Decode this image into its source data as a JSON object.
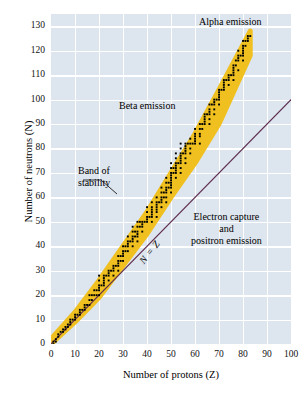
{
  "chart_data": {
    "type": "scatter",
    "title": "",
    "xlabel": "Number of protons (Z)",
    "ylabel": "Number of neutrons (N)",
    "xlim": [
      0,
      100
    ],
    "ylim": [
      0,
      135
    ],
    "xticks": [
      0,
      10,
      20,
      30,
      40,
      50,
      60,
      70,
      80,
      90,
      100
    ],
    "yticks": [
      0,
      10,
      20,
      30,
      40,
      50,
      60,
      70,
      80,
      90,
      100,
      110,
      120,
      130
    ],
    "grid": true,
    "legend": "none",
    "background_color": "#dde5ee",
    "gridline_color": "#ffffff",
    "band_color": "#efc01f",
    "point_color": "#000000",
    "line_color": "#5c2a4e",
    "annotations": [
      {
        "name": "alpha-emission",
        "text": "Alpha emission",
        "x": 74,
        "y": 133
      },
      {
        "name": "beta-emission",
        "text": "Beta emission",
        "x": 40,
        "y": 97
      },
      {
        "name": "band-of-stability",
        "text": "Band of\nstability",
        "x": 17,
        "y": 70
      },
      {
        "name": "electron-capture",
        "text": "Electron capture\nand\npositron emission",
        "x": 77,
        "y": 52
      },
      {
        "name": "n-equals-z",
        "text": "N = Z",
        "x": 47,
        "y": 40,
        "rotation": -52
      }
    ],
    "reference_line": {
      "name": "N = Z",
      "label": "N = Z",
      "from": [
        0,
        0
      ],
      "to": [
        100,
        100
      ],
      "color": "#5c2a4e"
    },
    "band_of_stability": {
      "lower_edge": [
        [
          0,
          0
        ],
        [
          10,
          9
        ],
        [
          20,
          19
        ],
        [
          30,
          32
        ],
        [
          40,
          45
        ],
        [
          50,
          60
        ],
        [
          60,
          74
        ],
        [
          70,
          90
        ],
        [
          83,
          118
        ]
      ],
      "upper_edge": [
        [
          0,
          2
        ],
        [
          10,
          13
        ],
        [
          20,
          26
        ],
        [
          30,
          40
        ],
        [
          40,
          54
        ],
        [
          50,
          70
        ],
        [
          60,
          86
        ],
        [
          70,
          104
        ],
        [
          83,
          128
        ]
      ]
    },
    "stable_nuclides": [
      [
        1,
        0
      ],
      [
        1,
        1
      ],
      [
        2,
        1
      ],
      [
        2,
        2
      ],
      [
        3,
        3
      ],
      [
        3,
        4
      ],
      [
        4,
        5
      ],
      [
        5,
        5
      ],
      [
        5,
        6
      ],
      [
        6,
        6
      ],
      [
        6,
        7
      ],
      [
        7,
        7
      ],
      [
        7,
        8
      ],
      [
        8,
        8
      ],
      [
        8,
        9
      ],
      [
        8,
        10
      ],
      [
        9,
        10
      ],
      [
        10,
        10
      ],
      [
        10,
        11
      ],
      [
        10,
        12
      ],
      [
        11,
        12
      ],
      [
        12,
        12
      ],
      [
        12,
        13
      ],
      [
        12,
        14
      ],
      [
        13,
        14
      ],
      [
        14,
        14
      ],
      [
        14,
        15
      ],
      [
        14,
        16
      ],
      [
        15,
        16
      ],
      [
        16,
        16
      ],
      [
        16,
        18
      ],
      [
        16,
        20
      ],
      [
        17,
        18
      ],
      [
        17,
        20
      ],
      [
        18,
        20
      ],
      [
        18,
        22
      ],
      [
        19,
        20
      ],
      [
        19,
        22
      ],
      [
        20,
        20
      ],
      [
        20,
        22
      ],
      [
        20,
        23
      ],
      [
        20,
        24
      ],
      [
        20,
        26
      ],
      [
        20,
        28
      ],
      [
        21,
        24
      ],
      [
        22,
        24
      ],
      [
        22,
        25
      ],
      [
        22,
        26
      ],
      [
        22,
        27
      ],
      [
        22,
        28
      ],
      [
        23,
        28
      ],
      [
        24,
        26
      ],
      [
        24,
        28
      ],
      [
        24,
        29
      ],
      [
        24,
        30
      ],
      [
        25,
        30
      ],
      [
        26,
        28
      ],
      [
        26,
        30
      ],
      [
        26,
        31
      ],
      [
        26,
        32
      ],
      [
        27,
        32
      ],
      [
        28,
        30
      ],
      [
        28,
        32
      ],
      [
        28,
        33
      ],
      [
        28,
        34
      ],
      [
        28,
        36
      ],
      [
        29,
        34
      ],
      [
        29,
        36
      ],
      [
        30,
        34
      ],
      [
        30,
        36
      ],
      [
        30,
        37
      ],
      [
        30,
        38
      ],
      [
        30,
        40
      ],
      [
        31,
        38
      ],
      [
        31,
        40
      ],
      [
        32,
        38
      ],
      [
        32,
        40
      ],
      [
        32,
        41
      ],
      [
        32,
        42
      ],
      [
        32,
        44
      ],
      [
        33,
        42
      ],
      [
        34,
        40
      ],
      [
        34,
        42
      ],
      [
        34,
        43
      ],
      [
        34,
        44
      ],
      [
        34,
        46
      ],
      [
        34,
        48
      ],
      [
        35,
        44
      ],
      [
        35,
        46
      ],
      [
        36,
        42
      ],
      [
        36,
        44
      ],
      [
        36,
        45
      ],
      [
        36,
        46
      ],
      [
        36,
        48
      ],
      [
        36,
        50
      ],
      [
        37,
        48
      ],
      [
        37,
        50
      ],
      [
        38,
        46
      ],
      [
        38,
        48
      ],
      [
        38,
        49
      ],
      [
        38,
        50
      ],
      [
        39,
        50
      ],
      [
        40,
        50
      ],
      [
        40,
        51
      ],
      [
        40,
        52
      ],
      [
        40,
        54
      ],
      [
        40,
        56
      ],
      [
        41,
        52
      ],
      [
        42,
        50
      ],
      [
        42,
        52
      ],
      [
        42,
        53
      ],
      [
        42,
        54
      ],
      [
        42,
        55
      ],
      [
        42,
        56
      ],
      [
        42,
        58
      ],
      [
        44,
        52
      ],
      [
        44,
        54
      ],
      [
        44,
        55
      ],
      [
        44,
        56
      ],
      [
        44,
        57
      ],
      [
        44,
        58
      ],
      [
        44,
        60
      ],
      [
        45,
        58
      ],
      [
        46,
        56
      ],
      [
        46,
        58
      ],
      [
        46,
        59
      ],
      [
        46,
        60
      ],
      [
        46,
        62
      ],
      [
        46,
        64
      ],
      [
        47,
        60
      ],
      [
        47,
        62
      ],
      [
        48,
        58
      ],
      [
        48,
        60
      ],
      [
        48,
        62
      ],
      [
        48,
        63
      ],
      [
        48,
        64
      ],
      [
        48,
        66
      ],
      [
        48,
        68
      ],
      [
        49,
        64
      ],
      [
        49,
        66
      ],
      [
        50,
        62
      ],
      [
        50,
        64
      ],
      [
        50,
        65
      ],
      [
        50,
        66
      ],
      [
        50,
        67
      ],
      [
        50,
        68
      ],
      [
        50,
        69
      ],
      [
        50,
        70
      ],
      [
        50,
        72
      ],
      [
        50,
        74
      ],
      [
        51,
        70
      ],
      [
        51,
        72
      ],
      [
        52,
        68
      ],
      [
        52,
        70
      ],
      [
        52,
        71
      ],
      [
        52,
        72
      ],
      [
        52,
        73
      ],
      [
        52,
        74
      ],
      [
        52,
        76
      ],
      [
        52,
        78
      ],
      [
        53,
        74
      ],
      [
        54,
        70
      ],
      [
        54,
        72
      ],
      [
        54,
        74
      ],
      [
        54,
        75
      ],
      [
        54,
        76
      ],
      [
        54,
        77
      ],
      [
        54,
        78
      ],
      [
        54,
        80
      ],
      [
        54,
        82
      ],
      [
        55,
        78
      ],
      [
        56,
        74
      ],
      [
        56,
        76
      ],
      [
        56,
        78
      ],
      [
        56,
        79
      ],
      [
        56,
        80
      ],
      [
        56,
        81
      ],
      [
        56,
        82
      ],
      [
        57,
        82
      ],
      [
        58,
        78
      ],
      [
        58,
        80
      ],
      [
        58,
        82
      ],
      [
        58,
        84
      ],
      [
        59,
        82
      ],
      [
        60,
        82
      ],
      [
        60,
        83
      ],
      [
        60,
        84
      ],
      [
        60,
        85
      ],
      [
        60,
        86
      ],
      [
        60,
        88
      ],
      [
        62,
        82
      ],
      [
        62,
        85
      ],
      [
        62,
        86
      ],
      [
        62,
        88
      ],
      [
        62,
        90
      ],
      [
        63,
        88
      ],
      [
        63,
        90
      ],
      [
        64,
        90
      ],
      [
        64,
        91
      ],
      [
        64,
        92
      ],
      [
        64,
        93
      ],
      [
        64,
        94
      ],
      [
        65,
        94
      ],
      [
        66,
        90
      ],
      [
        66,
        92
      ],
      [
        66,
        94
      ],
      [
        66,
        95
      ],
      [
        66,
        96
      ],
      [
        66,
        98
      ],
      [
        67,
        98
      ],
      [
        68,
        94
      ],
      [
        68,
        96
      ],
      [
        68,
        98
      ],
      [
        68,
        99
      ],
      [
        68,
        100
      ],
      [
        69,
        100
      ],
      [
        70,
        98
      ],
      [
        70,
        100
      ],
      [
        70,
        101
      ],
      [
        70,
        102
      ],
      [
        70,
        103
      ],
      [
        70,
        104
      ],
      [
        71,
        104
      ],
      [
        72,
        104
      ],
      [
        72,
        105
      ],
      [
        72,
        106
      ],
      [
        72,
        107
      ],
      [
        72,
        108
      ],
      [
        73,
        108
      ],
      [
        74,
        106
      ],
      [
        74,
        108
      ],
      [
        74,
        109
      ],
      [
        74,
        110
      ],
      [
        75,
        110
      ],
      [
        76,
        108
      ],
      [
        76,
        110
      ],
      [
        76,
        111
      ],
      [
        76,
        112
      ],
      [
        76,
        113
      ],
      [
        76,
        114
      ],
      [
        77,
        114
      ],
      [
        77,
        116
      ],
      [
        78,
        112
      ],
      [
        78,
        116
      ],
      [
        78,
        117
      ],
      [
        78,
        118
      ],
      [
        78,
        120
      ],
      [
        79,
        118
      ],
      [
        80,
        116
      ],
      [
        80,
        118
      ],
      [
        80,
        119
      ],
      [
        80,
        120
      ],
      [
        80,
        121
      ],
      [
        80,
        122
      ],
      [
        80,
        124
      ],
      [
        81,
        122
      ],
      [
        81,
        124
      ],
      [
        82,
        124
      ],
      [
        82,
        125
      ],
      [
        82,
        126
      ],
      [
        83,
        126
      ]
    ]
  },
  "axes": {
    "x_title": "Number of protons (Z)",
    "y_title": "Number of neutrons (N)",
    "x_tick_labels": [
      "0",
      "10",
      "20",
      "30",
      "40",
      "50",
      "60",
      "70",
      "80",
      "90",
      "100"
    ],
    "y_tick_labels": [
      "0",
      "10",
      "20",
      "30",
      "40",
      "50",
      "60",
      "70",
      "80",
      "90",
      "100",
      "110",
      "120",
      "130"
    ]
  },
  "annotations": {
    "alpha_emission": "Alpha emission",
    "beta_emission": "Beta emission",
    "band_of_stability_line1": "Band of",
    "band_of_stability_line2": "stability",
    "electron_capture_line1": "Electron capture",
    "electron_capture_line2": "and",
    "electron_capture_line3": "positron emission",
    "n_equals_z": "N = Z"
  }
}
